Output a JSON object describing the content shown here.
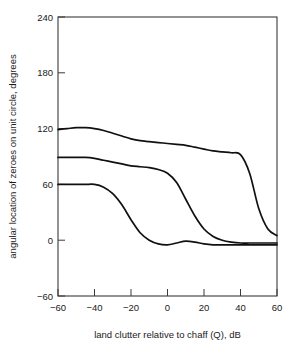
{
  "chart_data": {
    "type": "line",
    "title": "",
    "xlabel": "land clutter relative to chaff (Q), dB",
    "ylabel": "angular location of zeroes on unit circle, degrees",
    "xlim": [
      -60,
      60
    ],
    "ylim": [
      -60,
      240
    ],
    "xticks": [
      -60,
      -40,
      -20,
      0,
      20,
      40,
      60
    ],
    "yticks": [
      -60,
      0,
      60,
      120,
      180,
      240
    ],
    "xtick_labels": [
      "−60",
      "−40",
      "−20",
      "0",
      "20",
      "40",
      "60"
    ],
    "ytick_labels": [
      "−60",
      "0",
      "60",
      "120",
      "180",
      "240"
    ],
    "grid": false,
    "legend": "none",
    "x": [
      -60,
      -55,
      -50,
      -45,
      -40,
      -35,
      -30,
      -25,
      -20,
      -15,
      -10,
      -5,
      0,
      5,
      10,
      15,
      20,
      25,
      30,
      35,
      40,
      45,
      50,
      55,
      60
    ],
    "series": [
      {
        "name": "zero 3 (upper branch)",
        "values": [
          119,
          120,
          121,
          121,
          120,
          118,
          115,
          112,
          109,
          107,
          106,
          105,
          104,
          103,
          102,
          100,
          98,
          96,
          95,
          94,
          92,
          72,
          34,
          12,
          5
        ]
      },
      {
        "name": "zero 2 (middle branch)",
        "values": [
          89,
          89,
          89,
          89,
          88,
          86,
          84,
          82,
          80,
          79,
          78,
          76,
          72,
          62,
          44,
          26,
          12,
          4,
          0,
          -2,
          -3,
          -3,
          -3,
          -3,
          -3
        ]
      },
      {
        "name": "zero 1 (lower branch)",
        "values": [
          60,
          60,
          60,
          60,
          60,
          57,
          50,
          38,
          22,
          8,
          0,
          -4,
          -5,
          -3,
          -1,
          -2,
          -4,
          -5,
          -5,
          -5,
          -5,
          -5,
          -5,
          -5,
          -5
        ]
      }
    ]
  },
  "axes": {
    "x_title": "land clutter relative to chaff (Q), dB",
    "y_title": "angular location of zeroes on unit circle, degrees"
  },
  "xtick": {
    "t0": "−60",
    "t1": "−40",
    "t2": "−20",
    "t3": "0",
    "t4": "20",
    "t5": "40",
    "t6": "60"
  },
  "ytick": {
    "t0": "240",
    "t1": "180",
    "t2": "120",
    "t3": "60",
    "t4": "0",
    "t5": "−60"
  }
}
